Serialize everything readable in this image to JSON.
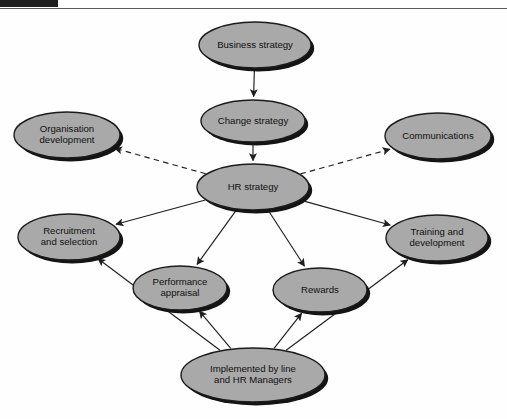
{
  "figure": {
    "background_color": "#fefefe",
    "node_fill_color": "#a9a9a9",
    "node_stroke_color": "#1b1b1b",
    "edge_color": "#1f1f1f",
    "header_bar_color": "#1d1d1d",
    "header_rule_color": "#5a5a5a"
  },
  "nodes": {
    "business_strategy": {
      "label": "Business strategy",
      "lines": [
        "Business strategy"
      ],
      "cx": 255,
      "cy": 45,
      "rx": 56,
      "ry": 23
    },
    "change_strategy": {
      "label": "Change strategy",
      "lines": [
        "Change strategy"
      ],
      "cx": 253,
      "cy": 121,
      "rx": 52,
      "ry": 21
    },
    "hr_strategy": {
      "label": "HR strategy",
      "lines": [
        "HR strategy"
      ],
      "cx": 253,
      "cy": 187,
      "rx": 56,
      "ry": 23
    },
    "organisation_development": {
      "label": "Organisation development",
      "lines": [
        "Organisation",
        "development"
      ],
      "cx": 67,
      "cy": 135,
      "rx": 53,
      "ry": 23
    },
    "communications": {
      "label": "Communications",
      "lines": [
        "Communications"
      ],
      "cx": 438,
      "cy": 136,
      "rx": 53,
      "ry": 23
    },
    "recruitment_and_selection": {
      "label": "Recruitment and selection",
      "lines": [
        "Recruitment",
        "and selection"
      ],
      "cx": 69,
      "cy": 237,
      "rx": 51,
      "ry": 23
    },
    "training_and_development": {
      "label": "Training and development",
      "lines": [
        "Training and",
        "development"
      ],
      "cx": 437,
      "cy": 238,
      "rx": 51,
      "ry": 23
    },
    "performance_appraisal": {
      "label": "Performance appraisal",
      "lines": [
        "Performance",
        "appraisal"
      ],
      "cx": 180,
      "cy": 288,
      "rx": 47,
      "ry": 22
    },
    "rewards": {
      "label": "Rewards",
      "lines": [
        "Rewards"
      ],
      "cx": 320,
      "cy": 290,
      "rx": 47,
      "ry": 22
    },
    "implemented_by": {
      "label": "Implemented by line and HR Managers",
      "lines": [
        "Implemented by line",
        "and HR Managers"
      ],
      "cx": 253,
      "cy": 375,
      "rx": 72,
      "ry": 27
    }
  },
  "edges": [
    {
      "id": "business-to-change",
      "from": "business_strategy",
      "to": "change_strategy",
      "style": "solid",
      "arrow": true
    },
    {
      "id": "change-to-hr",
      "from": "change_strategy",
      "to": "hr_strategy",
      "style": "solid",
      "arrow": true
    },
    {
      "id": "hr-to-organisation-development",
      "from": "hr_strategy",
      "to": "organisation_development",
      "style": "dashed",
      "arrow": true
    },
    {
      "id": "hr-to-communications",
      "from": "hr_strategy",
      "to": "communications",
      "style": "dashed",
      "arrow": true
    },
    {
      "id": "hr-to-recruitment",
      "from": "hr_strategy",
      "to": "recruitment_and_selection",
      "style": "solid",
      "arrow": true
    },
    {
      "id": "hr-to-training",
      "from": "hr_strategy",
      "to": "training_and_development",
      "style": "solid",
      "arrow": true
    },
    {
      "id": "hr-to-performance",
      "from": "hr_strategy",
      "to": "performance_appraisal",
      "style": "solid",
      "arrow": true
    },
    {
      "id": "hr-to-rewards",
      "from": "hr_strategy",
      "to": "rewards",
      "style": "solid",
      "arrow": true
    },
    {
      "id": "implemented-to-recruitment",
      "from": "implemented_by",
      "to": "recruitment_and_selection",
      "style": "solid",
      "arrow": true
    },
    {
      "id": "implemented-to-performance",
      "from": "implemented_by",
      "to": "performance_appraisal",
      "style": "solid",
      "arrow": true
    },
    {
      "id": "implemented-to-rewards",
      "from": "implemented_by",
      "to": "rewards",
      "style": "solid",
      "arrow": true
    },
    {
      "id": "implemented-to-training",
      "from": "implemented_by",
      "to": "training_and_development",
      "style": "solid",
      "arrow": true
    }
  ]
}
